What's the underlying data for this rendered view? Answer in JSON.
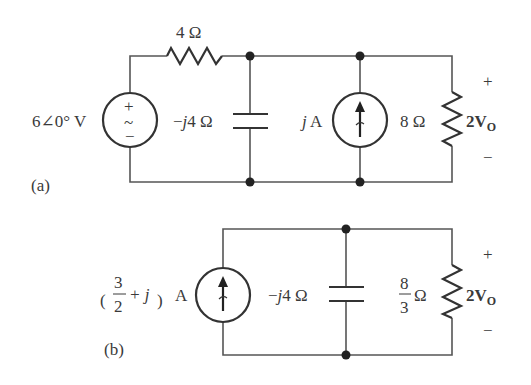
{
  "figure": {
    "type": "circuit-diagram",
    "colors": {
      "wire": "#555555",
      "component": "#333333",
      "text": "#3a3a3a",
      "background": "#ffffff"
    }
  },
  "circuit_a": {
    "panel_label": "(a)",
    "voltage_source": {
      "value": "6∠0° V",
      "plus": "+",
      "tilde": "~",
      "minus": "−"
    },
    "series_resistor": {
      "value": "4 Ω"
    },
    "capacitor": {
      "prefix": "−",
      "j": "j",
      "value": "4 Ω"
    },
    "current_source": {
      "j": "j",
      "unit": " A"
    },
    "load_resistor": {
      "value": "8 Ω"
    },
    "output_voltage": {
      "coef": "2V",
      "sub": "O",
      "plus": "+",
      "minus": "−"
    }
  },
  "circuit_b": {
    "panel_label": "(b)",
    "current_source": {
      "num": "3",
      "den": "2",
      "plus_j": "+ j",
      "unit": "A",
      "open_paren": "(",
      "close_paren": ")"
    },
    "capacitor": {
      "prefix": "−",
      "j": "j",
      "value": "4 Ω"
    },
    "load_resistor": {
      "num": "8",
      "den": "3",
      "unit": "Ω"
    },
    "output_voltage": {
      "coef": "2V",
      "sub": "O",
      "plus": "+",
      "minus": "−"
    }
  }
}
